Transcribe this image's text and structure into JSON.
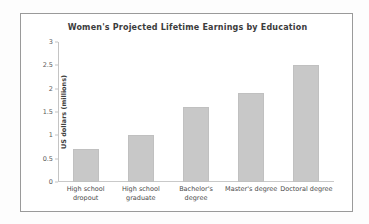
{
  "chart_data": {
    "type": "bar",
    "title": "Women's Projected Lifetime Earnings by Education",
    "xlabel": "",
    "ylabel": "US dollars (millions)",
    "categories": [
      "High school dropout",
      "High school graduate",
      "Bachelor's degree",
      "Master's degree",
      "Doctoral degree"
    ],
    "values": [
      0.7,
      1.0,
      1.6,
      1.9,
      2.5
    ],
    "ylim": [
      0,
      3
    ],
    "yticks": [
      0,
      0.5,
      1,
      1.5,
      2,
      2.5,
      3
    ],
    "ytick_labels": [
      "0",
      "0.5",
      "1",
      "1.5",
      "2",
      "2.5",
      "3"
    ],
    "grid": false,
    "legend": false,
    "bar_color": "#c8c8c8",
    "title_color": "#3c3c3c",
    "axis_color": "#c4c4c4",
    "background_color": "#ffffff"
  }
}
